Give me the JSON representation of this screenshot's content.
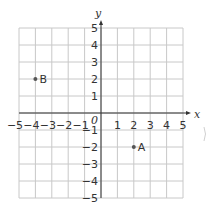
{
  "chart_data": {
    "type": "scatter",
    "title": "",
    "xlabel": "x",
    "ylabel": "y",
    "origin_label": "0",
    "xlim": [
      -5,
      5
    ],
    "ylim": [
      -5,
      5
    ],
    "grid": true,
    "x_ticks": [
      "−5",
      "−4",
      "−3",
      "−2",
      "−1",
      "1",
      "2",
      "3",
      "4",
      "5"
    ],
    "y_ticks": [
      "5",
      "4",
      "3",
      "2",
      "1",
      "−1",
      "−2",
      "−3",
      "−4",
      "−5"
    ],
    "points": [
      {
        "label": "A",
        "x": 2,
        "y": -2
      },
      {
        "label": "B",
        "x": -4,
        "y": 2
      }
    ]
  },
  "colors": {
    "grid": "#c8c8c8",
    "axis": "#333333",
    "point": "#555555"
  }
}
